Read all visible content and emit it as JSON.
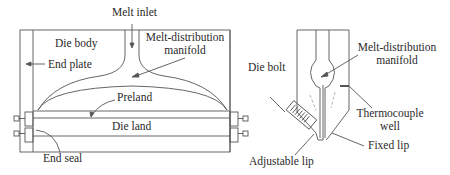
{
  "figure": {
    "left_view": {
      "title": "Flat die front view",
      "labels": {
        "melt_inlet": "Melt inlet",
        "die_body": "Die body",
        "end_plate": "End plate",
        "manifold_line1": "Melt-distribution",
        "manifold_line2": "manifold",
        "preland": "Preland",
        "die_land": "Die land",
        "end_seal": "End seal"
      }
    },
    "right_view": {
      "title": "Flat die cross-section",
      "labels": {
        "die_bolt": "Die bolt",
        "manifold_line1": "Melt-distribution",
        "manifold_line2": "manifold",
        "thermocouple_line1": "Thermocouple",
        "thermocouple_line2": "well",
        "fixed_lip": "Fixed lip",
        "adjustable_lip": "Adjustable lip"
      }
    },
    "colors": {
      "line": "#555555",
      "text": "#2a2a2a",
      "dashed": "#aaaaaa"
    }
  }
}
